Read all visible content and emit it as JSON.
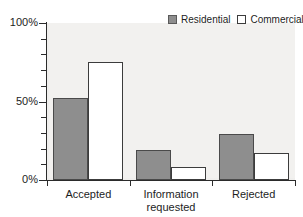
{
  "chart_data": {
    "type": "bar",
    "title": "",
    "subtitle": "",
    "xlabel": "",
    "ylabel": "",
    "ylim": [
      0,
      100
    ],
    "y_unit": "%",
    "grid": false,
    "legend_position": "top-right",
    "categories": [
      "Accepted",
      "Information\nrequested",
      "Rejected"
    ],
    "y_ticks_major": [
      {
        "value": 0,
        "label": "0%"
      },
      {
        "value": 50,
        "label": "50%"
      },
      {
        "value": 100,
        "label": "100%"
      }
    ],
    "y_ticks_minor": [
      10,
      20,
      30,
      40,
      60,
      70,
      80,
      90
    ],
    "series": [
      {
        "name": "Residential",
        "color": "#8e8e8e",
        "values": [
          52,
          19,
          29
        ]
      },
      {
        "name": "Commercial",
        "color": "#ffffff",
        "values": [
          75,
          8,
          17
        ]
      }
    ]
  },
  "legend": {
    "entries": [
      {
        "label": "Residential",
        "swatch": "residential-swatch"
      },
      {
        "label": "Commercial",
        "swatch": "commercial-swatch"
      }
    ]
  }
}
